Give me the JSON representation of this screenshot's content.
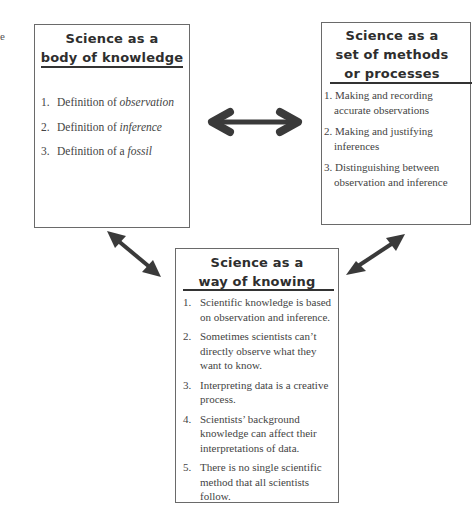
{
  "edge_fragment": "e",
  "boxes": {
    "knowledge": {
      "title_line1": "Science as a",
      "title_line2": "body of knowledge",
      "items": [
        {
          "num": "1.",
          "text": "Definition of ",
          "italic": "observation"
        },
        {
          "num": "2.",
          "text": "Definition of ",
          "italic": "inference"
        },
        {
          "num": "3.",
          "text": "Definition of a ",
          "italic": "fossil"
        }
      ]
    },
    "methods": {
      "title_line1": "Science as a",
      "title_line2": "set of methods",
      "title_line3": "or processes",
      "items": [
        {
          "num": "1.",
          "line1": "Making and recording",
          "line2": "accurate observations"
        },
        {
          "num": "2.",
          "line1": "Making and justifying",
          "line2": "inferences"
        },
        {
          "num": "3.",
          "line1": "Distinguishing between",
          "line2": "observation and inference"
        }
      ]
    },
    "knowing": {
      "title_line1": "Science as a",
      "title_line2": "way of knowing",
      "items": [
        {
          "num": "1.",
          "text": "Scientific knowledge is based on observation and inference."
        },
        {
          "num": "2.",
          "text": "Sometimes scientists can’t directly observe what they want to know."
        },
        {
          "num": "3.",
          "text": "Interpreting data is a creative process."
        },
        {
          "num": "4.",
          "text": "Scientists’ background knowledge can affect their interpretations of data."
        },
        {
          "num": "5.",
          "text": "There is no single scientific method that all scientists follow."
        }
      ]
    }
  },
  "arrows": [
    {
      "name": "knowledge-methods",
      "type": "double",
      "from": [
        209,
        122
      ],
      "to": [
        301,
        122
      ]
    },
    {
      "name": "knowledge-knowing",
      "type": "double",
      "from": [
        108,
        232
      ],
      "to": [
        160,
        276
      ]
    },
    {
      "name": "methods-knowing",
      "type": "double",
      "from": [
        404,
        235
      ],
      "to": [
        347,
        274
      ]
    }
  ],
  "colors": {
    "arrow": "#3a3a3a",
    "border": "#6a6a6a",
    "rule": "#333333",
    "text": "#444444"
  }
}
